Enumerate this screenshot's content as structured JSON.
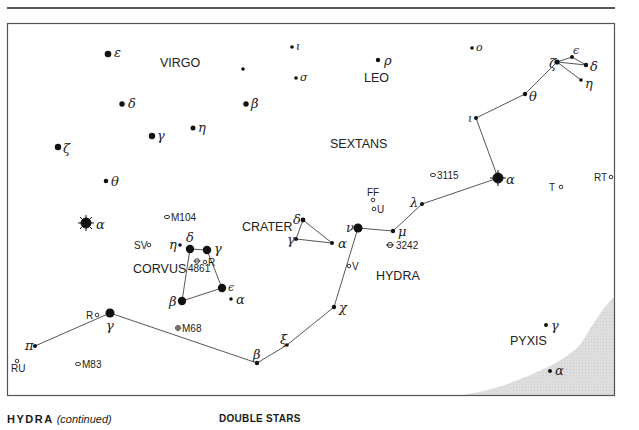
{
  "constellations": {
    "virgo": "VIRGO",
    "leo": "LEO",
    "sextans": "SEXTANS",
    "crater": "CRATER",
    "corvus": "CORVUS",
    "hydra": "HYDRA",
    "pyxis": "PYXIS"
  },
  "star_labels": {
    "virgo_epsilon": "ε",
    "virgo_delta": "δ",
    "virgo_gamma": "γ",
    "virgo_eta": "η",
    "virgo_zeta": "ζ",
    "virgo_theta": "θ",
    "virgo_alpha": "α",
    "virgo_beta": "β",
    "virgo_iota": "ι",
    "virgo_sigma": "σ",
    "leo_rho": "ρ",
    "leo_omicron": "ο",
    "hydra_zeta": "ζ",
    "hydra_epsilon": "ϵ",
    "hydra_delta": "δ",
    "hydra_eta": "η",
    "hydra_theta": "θ",
    "hydra_iota": "ι",
    "hydra_alpha": "α",
    "hydra_lambda": "λ",
    "hydra_mu": "μ",
    "hydra_nu": "ν",
    "hydra_chi": "χ",
    "hydra_xi": "ξ",
    "hydra_beta": "β",
    "hydra_gamma": "γ",
    "hydra_pi": "π",
    "crater_delta": "δ",
    "crater_gamma": "γ",
    "crater_alpha": "α",
    "corvus_delta": "δ",
    "corvus_gamma": "γ",
    "corvus_eta": "η",
    "corvus_epsilon": "ϵ",
    "corvus_beta": "β",
    "corvus_alpha": "α",
    "pyxis_gamma": "γ",
    "pyxis_alpha": "α"
  },
  "deep_sky": {
    "m104": "M104",
    "m68": "M68",
    "m83": "M83",
    "ngc3115": "3115",
    "ngc3242": "3242",
    "ngc4861": "4861"
  },
  "variable_stars": {
    "sv": "SV",
    "r_corvus": "R",
    "r_hydra": "R",
    "ru": "RU",
    "ff": "FF",
    "u": "U",
    "v": "V",
    "t": "T",
    "rt": "RT"
  },
  "footer": {
    "title": "HYDRA",
    "subtitle": "(continued)",
    "section": "DOUBLE STARS"
  },
  "colors": {
    "ink": "#1a1a1a",
    "frame": "#555555",
    "milky_way": "#dcdcdc"
  }
}
